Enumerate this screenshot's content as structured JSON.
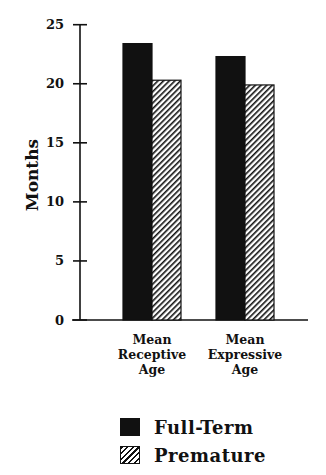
{
  "chart_data": {
    "type": "bar",
    "title": "",
    "xlabel": "",
    "ylabel": "Months",
    "ylim": [
      0,
      25
    ],
    "yticks": [
      0,
      5,
      10,
      15,
      20,
      25
    ],
    "grid": false,
    "legend_position": "bottom",
    "categories": [
      [
        "Mean",
        "Receptive",
        "Age"
      ],
      [
        "Mean",
        "Expressive",
        "Age"
      ]
    ],
    "category_names": [
      "Mean Receptive Age",
      "Mean Expressive Age"
    ],
    "series": [
      {
        "name": "Full-Term",
        "values": [
          23.4,
          22.3
        ],
        "fill": "solid",
        "color": "#111111"
      },
      {
        "name": "Premature",
        "values": [
          20.3,
          19.9
        ],
        "fill": "hatched",
        "color": "#111111"
      }
    ]
  },
  "legend": {
    "items": [
      {
        "label": "Full-Term"
      },
      {
        "label": "Premature"
      }
    ]
  }
}
